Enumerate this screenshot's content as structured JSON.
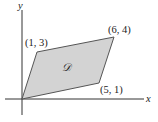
{
  "diagram": {
    "axes": {
      "x_label": "x",
      "y_label": "y"
    },
    "region": {
      "label": "𝒟",
      "fill": "#d3d3d3",
      "stroke": "#444444"
    },
    "vertices": [
      {
        "label": "(0, 0)",
        "shown": false
      },
      {
        "label": "(5, 1)"
      },
      {
        "label": "(6, 4)"
      },
      {
        "label": "(1, 3)"
      }
    ]
  }
}
